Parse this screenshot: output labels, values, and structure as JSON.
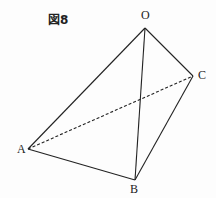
{
  "figure": {
    "label": "図8",
    "vertices": [
      {
        "name": "O",
        "x": 145,
        "y": 28
      },
      {
        "name": "A",
        "x": 28,
        "y": 149
      },
      {
        "name": "B",
        "x": 135,
        "y": 180
      },
      {
        "name": "C",
        "x": 193,
        "y": 76
      }
    ],
    "solid_edges": [
      "OA",
      "OB",
      "OC",
      "AB",
      "BC"
    ],
    "dashed_edges": [
      "AC"
    ]
  }
}
